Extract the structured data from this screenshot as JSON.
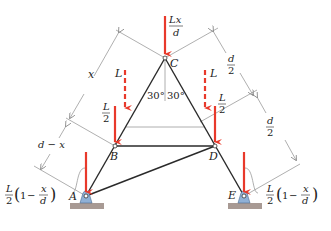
{
  "figure": {
    "type": "truss-diagram",
    "nodes": [
      {
        "id": "A",
        "label": "A",
        "x": 86,
        "y": 196
      },
      {
        "id": "B",
        "label": "B",
        "x": 115,
        "y": 146
      },
      {
        "id": "C",
        "label": "C",
        "x": 165,
        "y": 58
      },
      {
        "id": "D",
        "label": "D",
        "x": 215,
        "y": 146
      },
      {
        "id": "E",
        "label": "E",
        "x": 244,
        "y": 196
      }
    ],
    "members": [
      [
        "A",
        "B"
      ],
      [
        "B",
        "C"
      ],
      [
        "C",
        "D"
      ],
      [
        "D",
        "E"
      ],
      [
        "B",
        "D"
      ],
      [
        "A",
        "D"
      ]
    ],
    "angles": {
      "left": "30°",
      "right": "30°"
    },
    "loads": {
      "C": {
        "num": "Lx",
        "den": "d"
      },
      "B": {
        "num": "L",
        "den": "2"
      },
      "D": {
        "num": "L",
        "den": "2"
      },
      "moving_left": "L",
      "moving_right": "L"
    },
    "reactions": {
      "A": {
        "prefix_num": "L",
        "prefix_den": "2",
        "one": "1",
        "minus": "−",
        "frac_num": "x",
        "frac_den": "d"
      },
      "E": {
        "prefix_num": "L",
        "prefix_den": "2",
        "one": "1",
        "minus": "−",
        "frac_num": "x",
        "frac_den": "d"
      }
    },
    "dimensions": {
      "left_upper": "x",
      "left_lower": "d − x",
      "right_upper": {
        "num": "d",
        "den": "2"
      },
      "right_lower": {
        "num": "d",
        "den": "2"
      }
    },
    "colors": {
      "member": "#2a2a2a",
      "load": "#e8392b",
      "dimension": "#9a9a9a",
      "support": "#8fb0d6",
      "ground": "#a89a94"
    }
  }
}
